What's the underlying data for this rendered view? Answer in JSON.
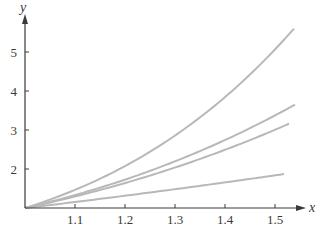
{
  "chart_data": {
    "type": "line",
    "title": "",
    "xlabel": "x",
    "ylabel": "y",
    "xlim": [
      1.0,
      1.56
    ],
    "ylim": [
      1.0,
      5.5
    ],
    "x_ticks": [
      "1.1",
      "1.2",
      "1.3",
      "1.4",
      "1.5"
    ],
    "y_ticks": [
      "2",
      "3",
      "4",
      "5"
    ],
    "grid": false,
    "legend": null,
    "series": [
      {
        "name": "curve-1 (steepest)",
        "x": [
          1.0,
          1.1,
          1.2,
          1.3,
          1.4,
          1.5,
          1.538
        ],
        "values": [
          1.0,
          1.46,
          2.07,
          2.86,
          3.84,
          5.06,
          5.6
        ]
      },
      {
        "name": "curve-2",
        "x": [
          1.0,
          1.1,
          1.2,
          1.3,
          1.4,
          1.5,
          1.54
        ],
        "values": [
          1.0,
          1.33,
          1.73,
          2.2,
          2.74,
          3.38,
          3.65
        ]
      },
      {
        "name": "curve-3",
        "x": [
          1.0,
          1.1,
          1.2,
          1.3,
          1.4,
          1.5,
          1.528
        ],
        "values": [
          1.0,
          1.3,
          1.64,
          2.04,
          2.5,
          3.01,
          3.16
        ]
      },
      {
        "name": "curve-4 (shallowest)",
        "x": [
          1.0,
          1.1,
          1.2,
          1.3,
          1.4,
          1.5,
          1.518
        ],
        "values": [
          1.0,
          1.15,
          1.31,
          1.48,
          1.66,
          1.84,
          1.87
        ]
      }
    ],
    "style": {
      "line_color": "#b8b8b8",
      "axis_color": "#3a3a3a"
    }
  }
}
